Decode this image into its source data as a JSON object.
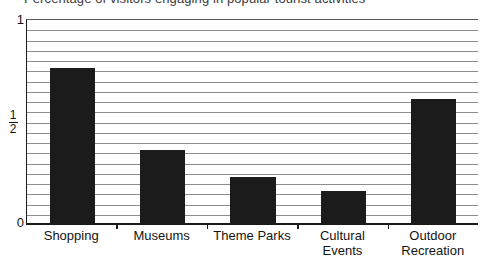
{
  "title": {
    "text": "Percentage of visitors engaging in popular tourist activities",
    "clipped": true
  },
  "axis": {
    "y_top_label": "1",
    "y_mid_numerator": "1",
    "y_mid_denominator": "2",
    "y_bottom_label": "0"
  },
  "colors": {
    "bar": "#1b1b1b",
    "gridline": "#8d8d8d",
    "axis": "#1a1a1a",
    "background": "#ffffff"
  },
  "chart_data": {
    "type": "bar",
    "title": "Percentage of visitors engaging in popular tourist activities",
    "xlabel": "",
    "ylabel": "",
    "ylim": [
      0,
      1
    ],
    "yticks": [
      0,
      0.5,
      1
    ],
    "ytick_labels": [
      "0",
      "1/2",
      "1"
    ],
    "grid": true,
    "gridline_count": 20,
    "legend": "none",
    "categories": [
      "Shopping",
      "Museums",
      "Theme Parks",
      "Cultural Events",
      "Outdoor Recreation"
    ],
    "category_lines": [
      [
        "Shopping"
      ],
      [
        "Museums"
      ],
      [
        "Theme Parks"
      ],
      [
        "Cultural",
        "Events"
      ],
      [
        "Outdoor",
        "Recreation"
      ]
    ],
    "values": [
      0.76,
      0.36,
      0.23,
      0.16,
      0.61
    ]
  }
}
